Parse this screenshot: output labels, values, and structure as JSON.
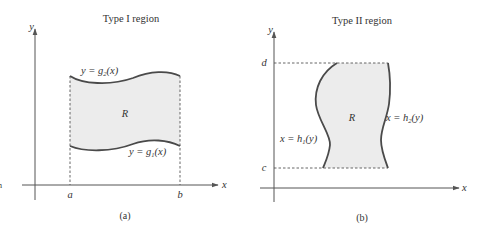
{
  "figure": {
    "panels": [
      {
        "id": "a",
        "title": "Type I region",
        "caption": "(a)",
        "axis_x_label": "x",
        "axis_y_label": "y",
        "region_label": "R",
        "x_ticks": [
          "a",
          "b"
        ],
        "upper_boundary": {
          "prefix": "y = g",
          "sub": "2",
          "suffix": "(x)"
        },
        "lower_boundary": {
          "prefix": "y = g",
          "sub": "1",
          "suffix": "(x)"
        }
      },
      {
        "id": "b",
        "title": "Type II region",
        "caption": "(b)",
        "axis_x_label": "x",
        "axis_y_label": "y",
        "region_label": "R",
        "y_ticks": [
          "d",
          "c"
        ],
        "left_boundary": {
          "prefix": "x = h",
          "sub": "1",
          "suffix": "(y)"
        },
        "right_boundary": {
          "prefix": "x = h",
          "sub": "2",
          "suffix": "(y)"
        }
      }
    ],
    "stray_mark": "n",
    "colors": {
      "region_fill": "#ececec",
      "curve": "#4a4a4a",
      "axis": "#555555",
      "text": "#333333"
    }
  }
}
